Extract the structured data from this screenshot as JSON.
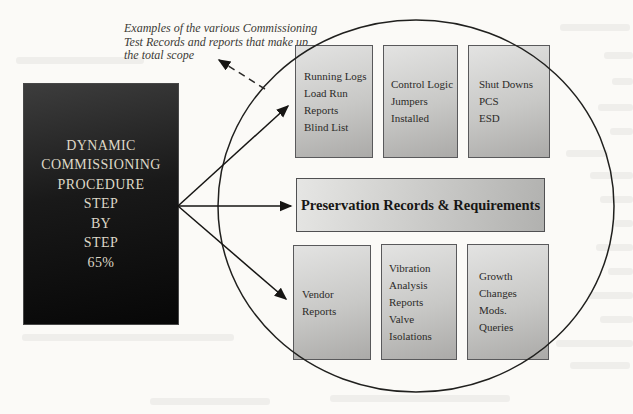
{
  "colors": {
    "paper": "#fbfaf7",
    "ink": "#1d1c1a",
    "box_border": "#59595b",
    "box_fill_light": "#e3e3e2",
    "box_fill_dark": "#abaaa8",
    "source_box_fill": "#070707",
    "source_box_text": "#ded8c7"
  },
  "caption": {
    "lines": [
      "Examples of the various Commissioning",
      "Test Records and reports that make up",
      "the total scope"
    ]
  },
  "source_box": {
    "lines": [
      "DYNAMIC",
      "COMMISSIONING",
      "PROCEDURE",
      "STEP",
      "BY",
      "STEP",
      "65%"
    ]
  },
  "scope_groups": {
    "top_row": [
      {
        "name": "running-logs",
        "lines": [
          "Running Logs",
          "Load Run",
          "Reports",
          "Blind List"
        ]
      },
      {
        "name": "control-logic",
        "lines": [
          "Control Logic",
          "Jumpers",
          "Installed"
        ]
      },
      {
        "name": "shut-downs",
        "lines": [
          "Shut Downs",
          "PCS",
          "ESD"
        ]
      }
    ],
    "middle_bar": {
      "label": "Preservation Records & Requirements"
    },
    "bottom_row": [
      {
        "name": "vendor-reports",
        "lines": [
          "Vendor",
          "Reports"
        ]
      },
      {
        "name": "vibration-analysis",
        "lines": [
          "Vibration",
          "Analysis",
          "Reports",
          "Valve",
          "Isolations"
        ]
      },
      {
        "name": "growth-changes",
        "lines": [
          "Growth",
          "Changes",
          "Mods.",
          "Queries"
        ]
      }
    ]
  }
}
